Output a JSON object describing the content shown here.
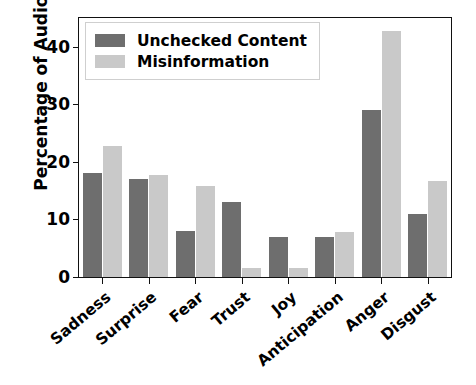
{
  "chart_data": {
    "type": "bar",
    "title": "",
    "xlabel": "",
    "ylabel": "Percentage of Audios",
    "categories": [
      "Sadness",
      "Surprise",
      "Fear",
      "Trust",
      "Joy",
      "Anticipation",
      "Anger",
      "Disgust"
    ],
    "series": [
      {
        "name": "Unchecked Content",
        "color": "#6e6e6e",
        "values": [
          18,
          17,
          8,
          13,
          7,
          7,
          29,
          11
        ]
      },
      {
        "name": "Misinformation",
        "color": "#c9c9c9",
        "values": [
          22.8,
          17.8,
          15.8,
          1.6,
          1.6,
          7.8,
          42.7,
          16.7
        ]
      }
    ],
    "ylim": [
      0,
      45
    ],
    "yticks": [
      0,
      10,
      20,
      30,
      40
    ],
    "ytick_labels": [
      "0",
      "10",
      "20",
      "30",
      "40"
    ],
    "grid": false,
    "legend_position": "upper left",
    "xtick_rotation": -40,
    "frame": true
  },
  "legend": {
    "entries": [
      {
        "label": "Unchecked Content"
      },
      {
        "label": "Misinformation"
      }
    ]
  },
  "axis": {
    "y_title": "Percentage of Audios"
  }
}
